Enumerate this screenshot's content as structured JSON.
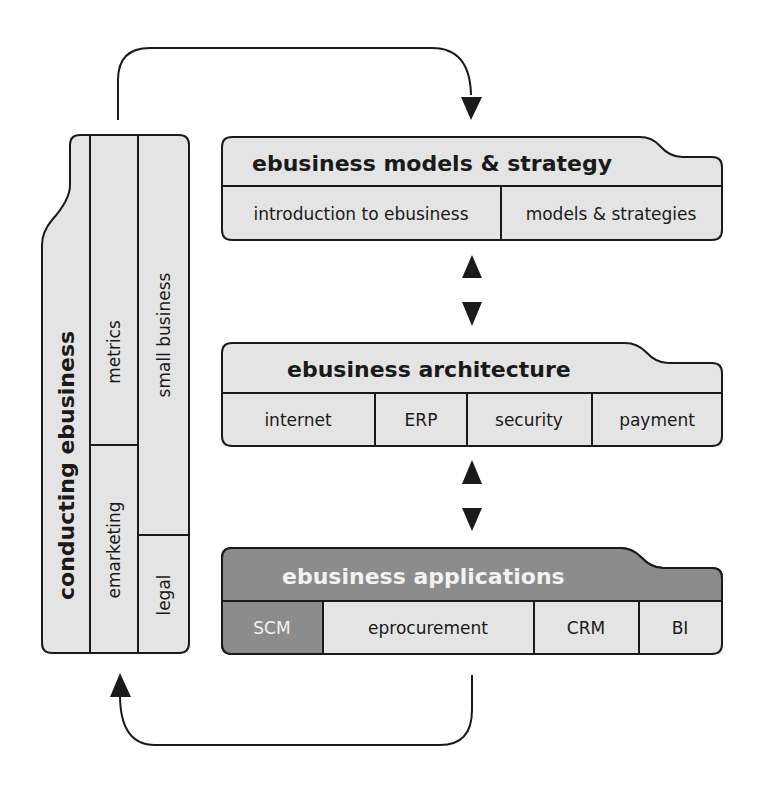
{
  "diagram": {
    "colors": {
      "box_fill": "#e4e4e4",
      "highlight_fill": "#8c8c8c",
      "stroke": "#1a1a1a",
      "highlight_text": "#f2f2f2"
    },
    "models_strategy": {
      "title": "ebusiness models & strategy",
      "cells": [
        "introduction to ebusiness",
        "models & strategies"
      ]
    },
    "architecture": {
      "title": "ebusiness architecture",
      "cells": [
        "internet",
        "ERP",
        "security",
        "payment"
      ]
    },
    "applications": {
      "title": "ebusiness applications",
      "cells": [
        "SCM",
        "eprocurement",
        "CRM",
        "BI"
      ],
      "highlighted_cell": "SCM"
    },
    "conducting": {
      "title": "conducting ebusiness",
      "cells": [
        "metrics",
        "emarketing",
        "small business",
        "legal"
      ]
    },
    "arrows": {
      "top_loop": "conducting ebusiness → ebusiness models & strategy",
      "bottom_loop": "ebusiness applications → conducting ebusiness",
      "bidirectional": [
        "models & strategy ↔ architecture",
        "architecture ↔ applications"
      ]
    }
  }
}
